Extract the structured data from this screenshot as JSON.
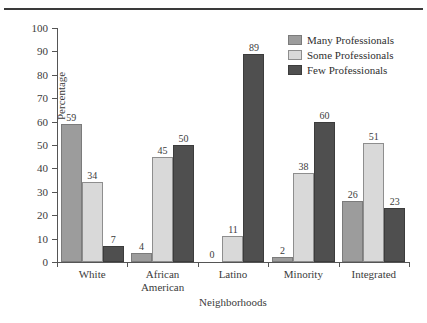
{
  "chart_data": {
    "type": "bar",
    "title": "",
    "xlabel": "Neighborhoods",
    "ylabel": "Percentage",
    "ylim": [
      0,
      100
    ],
    "yticks": [
      0,
      10,
      20,
      30,
      40,
      50,
      60,
      70,
      80,
      90,
      100
    ],
    "grid": false,
    "legend_position": "top-right",
    "categories": [
      "White",
      "African American",
      "Latino",
      "Minority",
      "Integrated"
    ],
    "category_lines": [
      [
        "White"
      ],
      [
        "African",
        "American"
      ],
      [
        "Latino"
      ],
      [
        "Minority"
      ],
      [
        "Integrated"
      ]
    ],
    "series": [
      {
        "name": "Many Professionals",
        "color": "#9c9c9c",
        "values": [
          59,
          4,
          0,
          2,
          26
        ]
      },
      {
        "name": "Some Professionals",
        "color": "#d9d9d9",
        "values": [
          34,
          45,
          11,
          38,
          51
        ]
      },
      {
        "name": "Few Professionals",
        "color": "#4f4f4f",
        "values": [
          7,
          50,
          89,
          60,
          23
        ]
      }
    ]
  },
  "legend": {
    "items": [
      {
        "label": "Many Professionals",
        "swatch": "many"
      },
      {
        "label": "Some Professionals",
        "swatch": "some"
      },
      {
        "label": "Few Professionals",
        "swatch": "few"
      }
    ]
  },
  "axes": {
    "y_title": "Percentage",
    "x_title": "Neighborhoods",
    "y_tick_labels": [
      "100",
      "90",
      "80",
      "70",
      "60",
      "50",
      "40",
      "30",
      "20",
      "10",
      "0"
    ]
  }
}
